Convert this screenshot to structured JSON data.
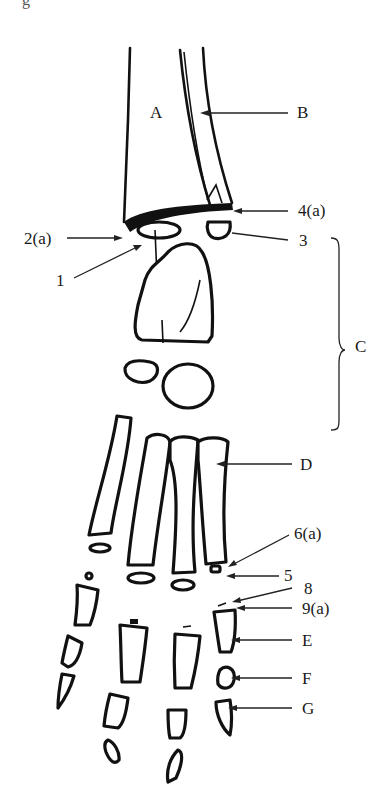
{
  "figure": {
    "top_fragment": "g",
    "colors": {
      "ink": "#111111",
      "background": "#ffffff"
    }
  },
  "labels": {
    "A": "A",
    "B": "B",
    "C": "C",
    "D": "D",
    "E": "E",
    "F": "F",
    "G": "G",
    "n1": "1",
    "n2a": "2(a)",
    "n3": "3",
    "n4a": "4(a)",
    "n5": "5",
    "n6a": "6(a)",
    "n8": "8",
    "n9a": "9(a)"
  }
}
